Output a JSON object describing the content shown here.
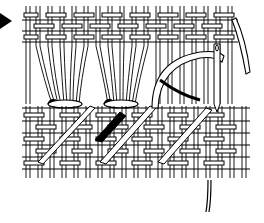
{
  "figure": {
    "subject": "Hemstitch embroidery illustration",
    "elements": [
      "pointer-arrow",
      "woven-fabric-top-band",
      "drawn-thread-area",
      "thread-bundles",
      "woven-fabric-bottom-band",
      "needle",
      "working-thread"
    ],
    "colors": {
      "ink": "#000000",
      "paper": "#ffffff"
    },
    "bundle_count": 3
  }
}
